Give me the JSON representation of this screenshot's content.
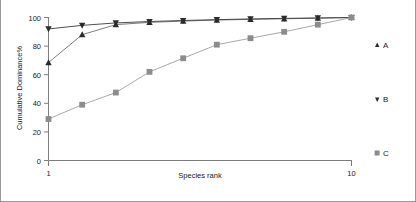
{
  "chart_data": {
    "type": "line",
    "title": "",
    "xlabel": "Species rank",
    "ylabel": "Cumulative Dominance%",
    "xlim": [
      1,
      10
    ],
    "ylim": [
      0,
      100
    ],
    "grid": false,
    "legend_position": "right",
    "x_ticks": [
      "1",
      "10"
    ],
    "x_tick_values": [
      1,
      10
    ],
    "y_ticks": [
      "0",
      "20",
      "40",
      "60",
      "80",
      "100"
    ],
    "y_tick_values": [
      0,
      20,
      40,
      60,
      80,
      100
    ],
    "x": [
      1,
      2,
      3,
      4,
      5,
      6,
      7,
      8,
      9,
      10
    ],
    "series": [
      {
        "name": "A",
        "marker": "triangle-up",
        "color": "#2b2b2b",
        "line_color": "#6e6e6e",
        "values": [
          68.5,
          88.0,
          95.0,
          96.6,
          97.5,
          98.2,
          98.7,
          99.1,
          99.5,
          100.0
        ]
      },
      {
        "name": "B",
        "marker": "triangle-down",
        "color": "#2b2b2b",
        "line_color": "#3c3c3c",
        "values": [
          92.0,
          94.5,
          96.2,
          97.2,
          97.9,
          98.5,
          99.0,
          99.4,
          99.7,
          100.0
        ]
      },
      {
        "name": "C",
        "marker": "square",
        "color": "#8c8c8c",
        "line_color": "#9e9e9e",
        "values": [
          29.0,
          39.0,
          47.5,
          62.0,
          71.5,
          81.0,
          85.5,
          90.0,
          95.0,
          100.0
        ]
      }
    ]
  },
  "legend": {
    "entries": [
      {
        "label": "A",
        "marker": "triangle-up-icon"
      },
      {
        "label": "B",
        "marker": "triangle-down-icon"
      },
      {
        "label": "C",
        "marker": "square-icon"
      }
    ]
  },
  "axes": {
    "y_title": "Cumulative Dominance%",
    "x_title": "Species rank",
    "y_tick_0": "0",
    "y_tick_20": "20",
    "y_tick_40": "40",
    "y_tick_60": "60",
    "y_tick_80": "80",
    "y_tick_100": "100",
    "x_tick_min": "1",
    "x_tick_max": "10"
  }
}
